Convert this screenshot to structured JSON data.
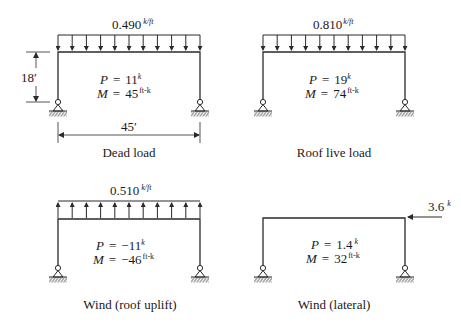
{
  "figure": {
    "panels": [
      {
        "id": "dead-load",
        "caption": "Dead load",
        "load_value": "0.490",
        "load_unit": "k/ft",
        "load_direction": "down",
        "P_label": "P",
        "P_value": "11",
        "P_unit": "k",
        "M_label": "M",
        "M_value": "45",
        "M_unit": "ft-k",
        "height_dim": "18′",
        "span_dim": "45′"
      },
      {
        "id": "roof-live-load",
        "caption": "Roof live load",
        "load_value": "0.810",
        "load_unit": "k/ft",
        "load_direction": "down",
        "P_label": "P",
        "P_value": "19",
        "P_unit": "k",
        "M_label": "M",
        "M_value": "74",
        "M_unit": "ft-k"
      },
      {
        "id": "wind-roof-uplift",
        "caption": "Wind (roof uplift)",
        "load_value": "0.510",
        "load_unit": "k/ft",
        "load_direction": "up",
        "P_label": "P",
        "P_value": "−11",
        "P_unit": "k",
        "M_label": "M",
        "M_value": "−46",
        "M_unit": "ft-k"
      },
      {
        "id": "wind-lateral",
        "caption": "Wind (lateral)",
        "point_load_value": "3.6",
        "point_load_unit": "k",
        "load_direction": "left",
        "P_label": "P",
        "P_value": "1.4",
        "P_unit": "k",
        "M_label": "M",
        "M_value": "32",
        "M_unit": "ft-k"
      }
    ],
    "eq_sign": "="
  }
}
